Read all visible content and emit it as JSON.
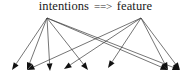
{
  "figure": {
    "width": 191,
    "height": 82,
    "background": "#ffffff",
    "line_color": "#3a3a3a",
    "arrowhead_color": "#111111",
    "text_color": "#1a1a1a"
  },
  "labels": {
    "source_left": "intentions",
    "relation": "==>",
    "source_right": "feature",
    "full_caption": "intentions ==> feature"
  },
  "graph": {
    "type": "directed-fanout",
    "source_nodes": [
      {
        "id": "intentions",
        "label": "intentions",
        "x": 47,
        "y": 18
      },
      {
        "id": "feature",
        "label": "feature",
        "x": 141,
        "y": 18
      }
    ],
    "target_nodes": [
      {
        "id": "t1",
        "x": 12,
        "y": 70,
        "angle": 35
      },
      {
        "id": "t2",
        "x": 27,
        "y": 70,
        "angle": 55
      },
      {
        "id": "t3",
        "x": 50,
        "y": 71,
        "angle": 90
      },
      {
        "id": "t4",
        "x": 64,
        "y": 69,
        "angle": 55
      },
      {
        "id": "t5",
        "x": 88,
        "y": 70,
        "angle": 130
      },
      {
        "id": "t6",
        "x": 108,
        "y": 68,
        "angle": 25
      },
      {
        "id": "t7",
        "x": 168,
        "y": 70,
        "angle": 60
      },
      {
        "id": "t8",
        "x": 180,
        "y": 70,
        "angle": 115
      }
    ],
    "edges": [
      {
        "from": "intentions",
        "to": "t1"
      },
      {
        "from": "intentions",
        "to": "t2"
      },
      {
        "from": "intentions",
        "to": "t3"
      },
      {
        "from": "intentions",
        "to": "t5"
      },
      {
        "from": "intentions",
        "to": "t7"
      },
      {
        "from": "intentions",
        "to": "t8"
      },
      {
        "from": "feature",
        "to": "t2"
      },
      {
        "from": "feature",
        "to": "t4"
      },
      {
        "from": "feature",
        "to": "t6"
      },
      {
        "from": "feature",
        "to": "t7"
      },
      {
        "from": "feature",
        "to": "t8"
      }
    ]
  }
}
